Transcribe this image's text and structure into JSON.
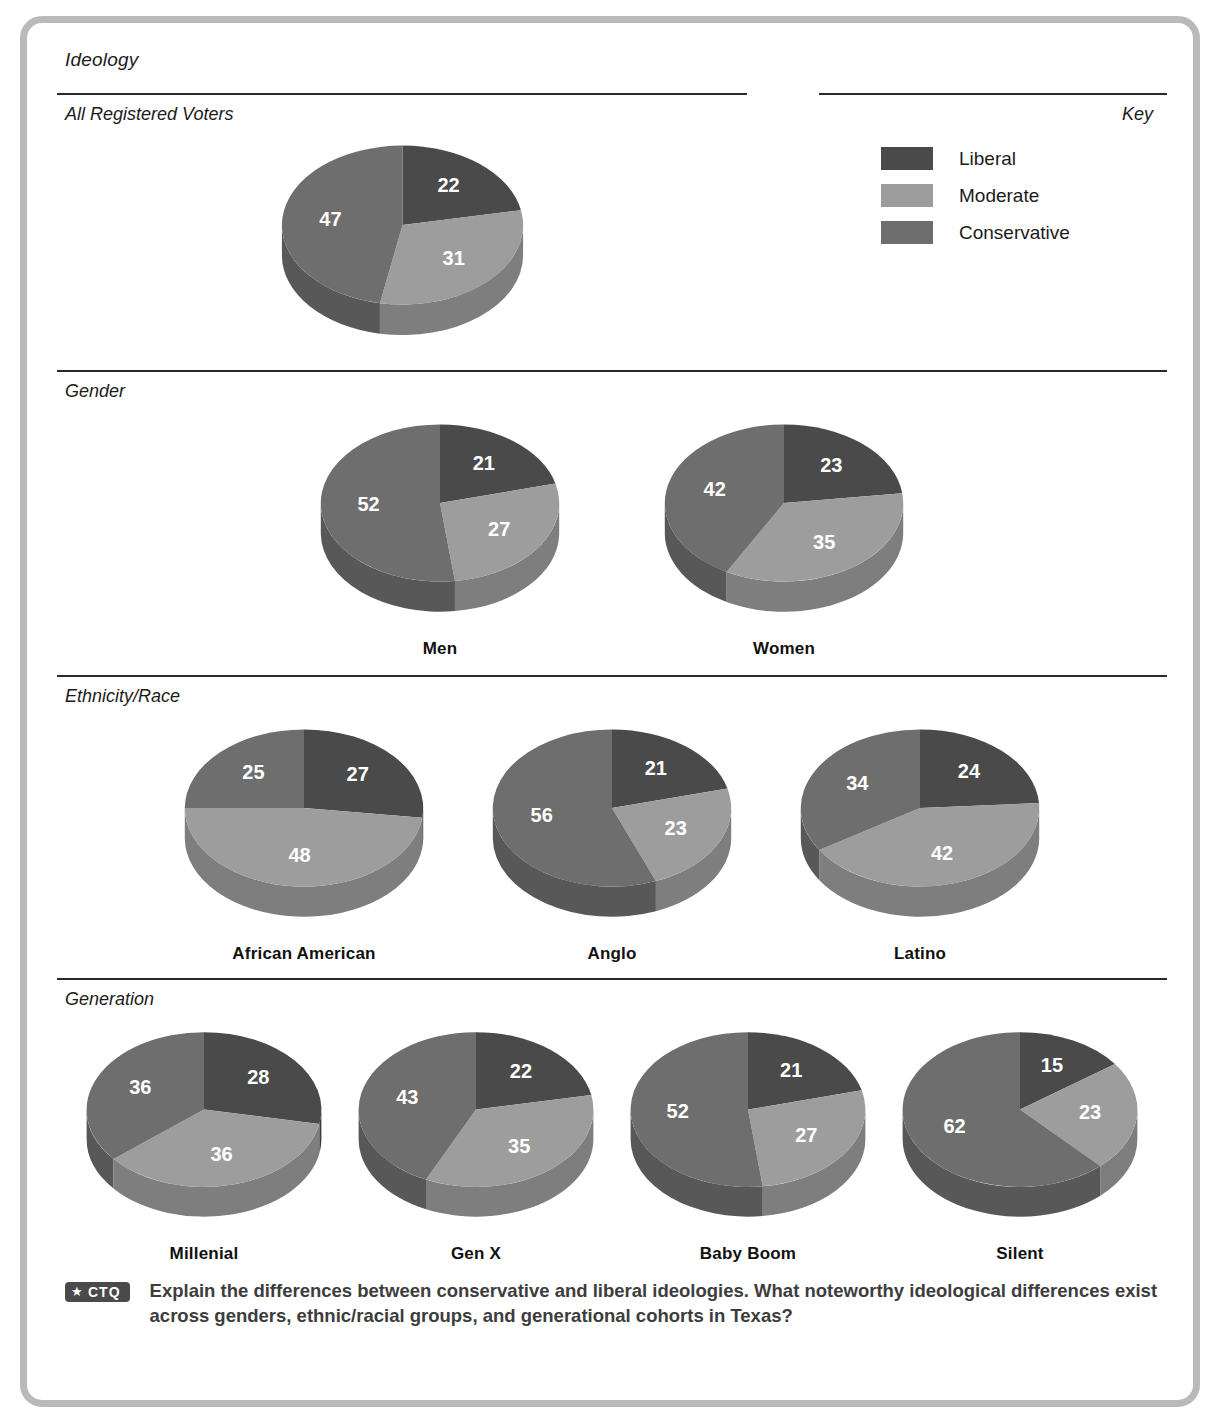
{
  "chart_title": "Ideology",
  "sections": {
    "all_voters": {
      "label": "All Registered Voters"
    },
    "gender": {
      "label": "Gender"
    },
    "ethnicity": {
      "label": "Ethnicity/Race"
    },
    "generation": {
      "label": "Generation"
    }
  },
  "key": {
    "label": "Key",
    "items": [
      {
        "name": "Liberal",
        "color": "#4a4a4a"
      },
      {
        "name": "Moderate",
        "color": "#9d9d9d"
      },
      {
        "name": "Conservative",
        "color": "#6e6e6e"
      }
    ]
  },
  "footer": {
    "badge_star": "★",
    "badge_abbr": "CTQ",
    "question": "Explain the differences between conservative and liberal ideologies. What noteworthy ideological differences exist across genders, ethnic/racial groups, and generational cohorts in Texas?"
  },
  "chart_data": {
    "type": "pie",
    "title": "Ideology",
    "legend_position": "top-right",
    "legend_title": "Key",
    "categories": [
      "Liberal",
      "Moderate",
      "Conservative"
    ],
    "colors": [
      "#4a4a4a",
      "#9d9d9d",
      "#6e6e6e"
    ],
    "units": "percent",
    "groups": [
      {
        "section": "All Registered Voters",
        "label": "",
        "values": [
          22,
          31,
          47
        ]
      },
      {
        "section": "Gender",
        "label": "Men",
        "values": [
          21,
          27,
          52
        ]
      },
      {
        "section": "Gender",
        "label": "Women",
        "values": [
          23,
          35,
          42
        ]
      },
      {
        "section": "Ethnicity/Race",
        "label": "African American",
        "values": [
          27,
          48,
          25
        ]
      },
      {
        "section": "Ethnicity/Race",
        "label": "Anglo",
        "values": [
          21,
          23,
          56
        ]
      },
      {
        "section": "Ethnicity/Race",
        "label": "Latino",
        "values": [
          24,
          42,
          34
        ]
      },
      {
        "section": "Generation",
        "label": "Millenial",
        "values": [
          28,
          36,
          36
        ]
      },
      {
        "section": "Generation",
        "label": "Gen X",
        "values": [
          22,
          35,
          43
        ]
      },
      {
        "section": "Generation",
        "label": "Baby Boom",
        "values": [
          21,
          27,
          52
        ]
      },
      {
        "section": "Generation",
        "label": "Silent",
        "values": [
          15,
          23,
          62
        ]
      }
    ]
  }
}
